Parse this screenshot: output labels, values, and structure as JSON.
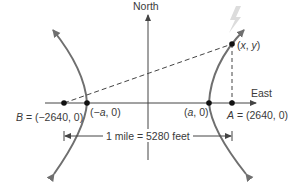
{
  "diagram": {
    "type": "hyperbola-location-diagram",
    "axes": {
      "vertical_label": "North",
      "horizontal_label": "East"
    },
    "points": {
      "B": {
        "label_prefix": "B",
        "label_rest": " = (−2640, 0)"
      },
      "neg_vertex": {
        "label_open": "(−",
        "label_var": "a",
        "label_close": ", 0)"
      },
      "pos_vertex": {
        "label_open": "(",
        "label_var": "a",
        "label_close": ", 0)"
      },
      "A": {
        "label_prefix": "A",
        "label_rest": " = (2640, 0)"
      },
      "lightning_point": {
        "label_open": "(",
        "label_x": "x",
        "label_sep": ", ",
        "label_y": "y",
        "label_close": ")"
      }
    },
    "dimension": {
      "label": "1 mile = 5280 feet"
    },
    "icons": {
      "lightning": "lightning-bolt-icon"
    },
    "colors": {
      "curve": "#6f6f6f",
      "axis": "#444444",
      "text": "#3a3a3a",
      "lightning": "#d9d9d9"
    }
  }
}
